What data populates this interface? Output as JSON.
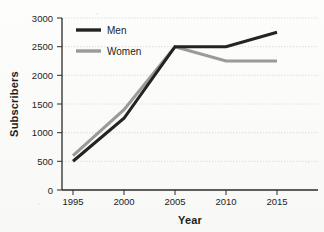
{
  "chart_data": {
    "type": "line",
    "title": "",
    "xlabel": "Year",
    "ylabel": "Subscribers",
    "categories": [
      "1995",
      "2000",
      "2005",
      "2010",
      "2015"
    ],
    "x": [
      1995,
      2000,
      2005,
      2010,
      2015
    ],
    "xlim": [
      1993,
      2017
    ],
    "ylim": [
      0,
      3000
    ],
    "yticks": [
      0,
      500,
      1000,
      1500,
      2000,
      2500,
      3000
    ],
    "ytick_labels": [
      "0",
      "500",
      "1000",
      "1500",
      "2000",
      "2500",
      "3000"
    ],
    "xtick_labels": [
      "1995",
      "2000",
      "2005",
      "2010",
      "2015"
    ],
    "grid": "horizontal",
    "legend_position": "upper-left-inside",
    "series": [
      {
        "name": "Men",
        "color": "#232323",
        "values": [
          500,
          1250,
          2500,
          2500,
          2750
        ]
      },
      {
        "name": "Women",
        "color": "#9a9a9a",
        "values": [
          600,
          1400,
          2500,
          2250,
          2250
        ]
      }
    ]
  },
  "legend": {
    "items": [
      {
        "label": "Men",
        "swatch_color": "#232323"
      },
      {
        "label": "Women",
        "swatch_color": "#9a9a9a"
      }
    ]
  },
  "axes": {
    "y_title": "Subscribers",
    "x_title": "Year",
    "y_ticks": [
      "3000",
      "2500",
      "2000",
      "1500",
      "1000",
      "500",
      "0"
    ],
    "x_ticks": [
      "1995",
      "2000",
      "2005",
      "2010",
      "2015"
    ]
  },
  "colors": {
    "men_line": "#232323",
    "women_line": "#9a9a9a",
    "grid": "#c9c9c9",
    "axis": "#2a2a2a",
    "background": "#fbfbfa"
  }
}
